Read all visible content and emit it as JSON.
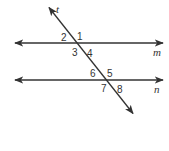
{
  "diagram": {
    "type": "parallel-lines-cut-by-transversal",
    "line_color": "#333333",
    "lines": {
      "m": {
        "label": "m",
        "y": 43,
        "x1": 13,
        "x2": 165
      },
      "n": {
        "label": "n",
        "y": 80,
        "x1": 13,
        "x2": 165
      },
      "t": {
        "label": "t",
        "x1": 48,
        "y1": 6,
        "x2": 134,
        "y2": 115
      }
    },
    "angle_labels": {
      "a1": "1",
      "a2": "2",
      "a3": "3",
      "a4": "4",
      "a5": "5",
      "a6": "6",
      "a7": "7",
      "a8": "8"
    }
  }
}
